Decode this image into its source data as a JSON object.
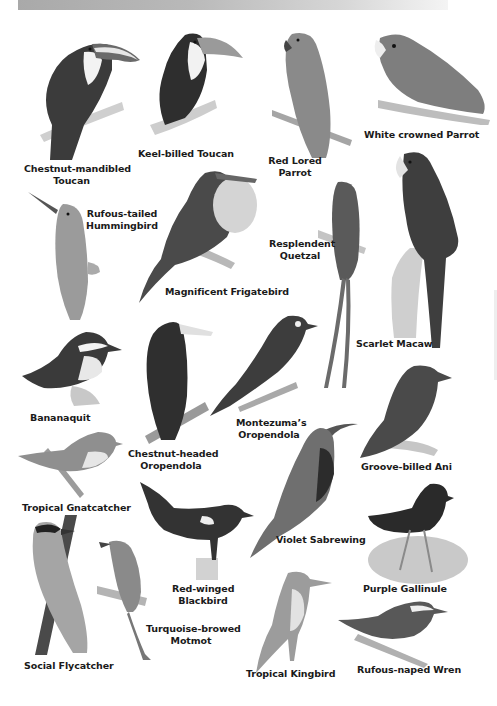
{
  "page": {
    "type": "bird illustration plate",
    "header_bar_colors": [
      "#a9a9a9",
      "#f4f4f4"
    ]
  },
  "birds": [
    {
      "name": "Chestnut-mandibled Toucan",
      "lines": [
        "Chestnut-mandibled",
        "Toucan"
      ]
    },
    {
      "name": "Keel-billed Toucan",
      "lines": [
        "Keel-billed Toucan"
      ]
    },
    {
      "name": "Red Lored Parrot",
      "lines": [
        "Red Lored",
        "Parrot"
      ]
    },
    {
      "name": "White crowned Parrot",
      "lines": [
        "White crowned Parrot"
      ]
    },
    {
      "name": "Rufous-tailed Hummingbird",
      "lines": [
        "Rufous-tailed",
        "Hummingbird"
      ]
    },
    {
      "name": "Magnificent Frigatebird",
      "lines": [
        "Magnificent Frigatebird"
      ]
    },
    {
      "name": "Resplendent Quetzal",
      "lines": [
        "Resplendent",
        "Quetzal"
      ]
    },
    {
      "name": "Scarlet Macaw",
      "lines": [
        "Scarlet Macaw"
      ]
    },
    {
      "name": "Bananaquit",
      "lines": [
        "Bananaquit"
      ]
    },
    {
      "name": "Chestnut-headed Oropendola",
      "lines": [
        "Chestnut-headed",
        "Oropendola"
      ]
    },
    {
      "name": "Montezuma's Oropendola",
      "lines": [
        "Montezuma’s",
        "Oropendola"
      ]
    },
    {
      "name": "Groove-billed Ani",
      "lines": [
        "Groove-billed Ani"
      ]
    },
    {
      "name": "Tropical Gnatcatcher",
      "lines": [
        "Tropical Gnatcatcher"
      ]
    },
    {
      "name": "Violet Sabrewing",
      "lines": [
        "Violet Sabrewing"
      ]
    },
    {
      "name": "Red-winged Blackbird",
      "lines": [
        "Red-winged",
        "Blackbird"
      ]
    },
    {
      "name": "Purple Gallinule",
      "lines": [
        "Purple Gallinule"
      ]
    },
    {
      "name": "Social Flycatcher",
      "lines": [
        "Social Flycatcher"
      ]
    },
    {
      "name": "Turquoise-browed Motmot",
      "lines": [
        "Turquoise-browed",
        "Motmot"
      ]
    },
    {
      "name": "Tropical Kingbird",
      "lines": [
        "Tropical Kingbird"
      ]
    },
    {
      "name": "Rufous-naped Wren",
      "lines": [
        "Rufous-naped Wren"
      ]
    }
  ]
}
